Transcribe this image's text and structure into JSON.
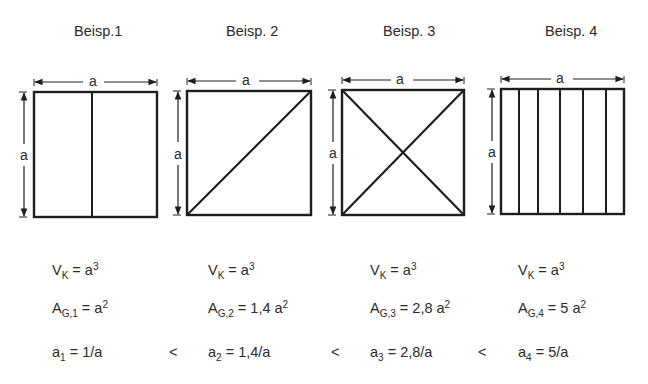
{
  "examples": [
    {
      "title": "Beisp.1",
      "dim_label_width": "a",
      "dim_label_height": "a",
      "division": "one vertical line (2 parts)",
      "volume": {
        "symbol": "V",
        "sub": "K",
        "eq": " = a",
        "sup": "3"
      },
      "area": {
        "symbol": "A",
        "sub": "G,1",
        "eq": " = a",
        "sup": "2"
      },
      "ratio": {
        "symbol": "a",
        "sub": "1",
        "eq": " = 1/a"
      }
    },
    {
      "title": "Beisp. 2",
      "dim_label_width": "a",
      "dim_label_height": "a",
      "division": "one diagonal",
      "volume": {
        "symbol": "V",
        "sub": "K",
        "eq": " = a",
        "sup": "3"
      },
      "area": {
        "symbol": "A",
        "sub": "G,2",
        "eq": " = 1,4 a",
        "sup": "2"
      },
      "ratio": {
        "symbol": "a",
        "sub": "2",
        "eq": " = 1,4/a"
      }
    },
    {
      "title": "Beisp. 3",
      "dim_label_width": "a",
      "dim_label_height": "a",
      "division": "two diagonals (X)",
      "volume": {
        "symbol": "V",
        "sub": "K",
        "eq": " = a",
        "sup": "3"
      },
      "area": {
        "symbol": "A",
        "sub": "G,3",
        "eq": " = 2,8 a",
        "sup": "2"
      },
      "ratio": {
        "symbol": "a",
        "sub": "3",
        "eq": " = 2,8/a"
      }
    },
    {
      "title": "Beisp. 4",
      "dim_label_width": "a",
      "dim_label_height": "a",
      "division": "five vertical lines (6 parts)",
      "volume": {
        "symbol": "V",
        "sub": "K",
        "eq": " = a",
        "sup": "3"
      },
      "area": {
        "symbol": "A",
        "sub": "G,4",
        "eq": " = 5 a",
        "sup": "2"
      },
      "ratio": {
        "symbol": "a",
        "sub": "4",
        "eq": " = 5/a"
      }
    }
  ],
  "comparators": [
    "<",
    "<",
    "<"
  ],
  "colors": {
    "line": "#1e1e1e",
    "text": "#2a2a2a",
    "background": "#ffffff"
  }
}
